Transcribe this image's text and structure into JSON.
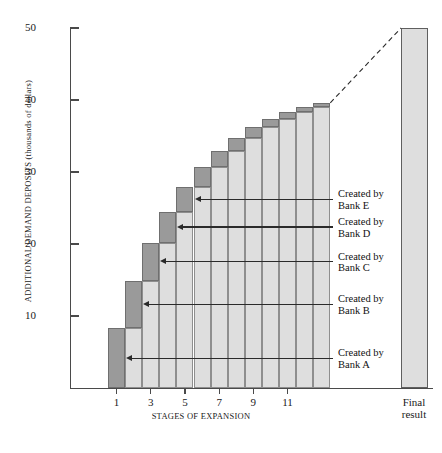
{
  "chart_data": {
    "type": "bar",
    "title": "",
    "xlabel": "STAGES OF EXPANSION",
    "ylabel": "ADDITIONAL DEMAND DEPOSITS (thousands of dollars)",
    "ylim": [
      0,
      50
    ],
    "y_ticks": [
      10,
      20,
      30,
      40,
      50
    ],
    "x_ticks": [
      1,
      3,
      5,
      7,
      9,
      11
    ],
    "grid": false,
    "legend": null,
    "categories": [
      1,
      2,
      3,
      4,
      5,
      6,
      7,
      8,
      9,
      10,
      11,
      12,
      13
    ],
    "values": [
      8.3,
      14.9,
      20.2,
      24.5,
      27.9,
      30.7,
      32.9,
      34.7,
      36.2,
      37.3,
      38.3,
      39.0,
      39.6
    ],
    "series": [
      {
        "name": "cumulative-deposits",
        "values": [
          8.3,
          14.9,
          20.2,
          24.5,
          27.9,
          30.7,
          32.9,
          34.7,
          36.2,
          37.3,
          38.3,
          39.0,
          39.6
        ]
      },
      {
        "name": "new-deposit-increment",
        "values": [
          8.3,
          6.6,
          5.3,
          4.3,
          3.4,
          2.8,
          2.2,
          1.8,
          1.5,
          1.1,
          1.0,
          0.7,
          0.6
        ]
      }
    ],
    "final_result": {
      "label_line1": "Final",
      "label_line2": "result",
      "value": 50
    },
    "annotations": [
      {
        "id": "bank-e",
        "line1": "Created by",
        "line2": "Bank E",
        "target_stage": 5,
        "target_value": 27.9
      },
      {
        "id": "bank-d",
        "line1": "Created by",
        "line2": "Bank D",
        "target_stage": 4,
        "target_value": 24.5
      },
      {
        "id": "bank-c",
        "line1": "Created by",
        "line2": "Bank C",
        "target_stage": 3,
        "target_value": 20.2
      },
      {
        "id": "bank-b",
        "line1": "Created by",
        "line2": "Bank B",
        "target_stage": 2,
        "target_value": 14.9
      },
      {
        "id": "bank-a",
        "line1": "Created by",
        "line2": "Bank A",
        "target_stage": 1,
        "target_value": 8.3
      }
    ],
    "colors": {
      "bar_light": "#dedede",
      "bar_dark": "#9a9a9a",
      "bar_outline": "#8e8e8e",
      "axis": "#4a4a4a",
      "text": "#1a1a1a",
      "annotation_line": "#2a2a2a",
      "background": "#ffffff"
    },
    "dashed_connector": {
      "from_stage": 13,
      "from_value": 39.6,
      "to_label": "Final result",
      "to_value": 50
    }
  }
}
